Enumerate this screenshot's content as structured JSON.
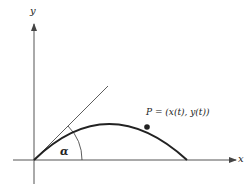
{
  "diagram": {
    "axes": {
      "x_label": "x",
      "y_label": "y"
    },
    "angle_label": "α",
    "point_label": "P = (x(t), y(t))",
    "colors": {
      "ink": "#222222",
      "axis": "#555555"
    }
  }
}
